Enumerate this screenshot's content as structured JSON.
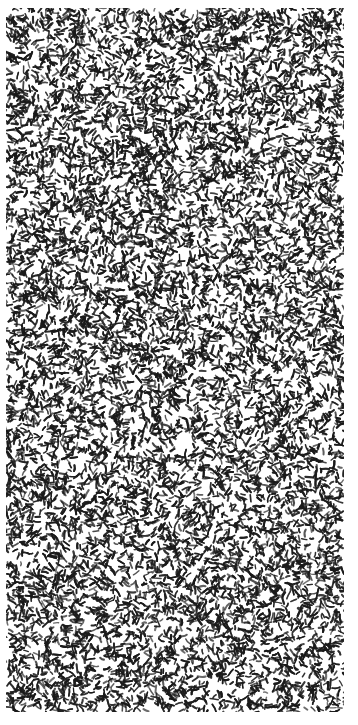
{
  "image": {
    "kind": "noise-texture",
    "width": 358,
    "height": 725,
    "pattern_area": {
      "x": 6,
      "y": 8,
      "width": 338,
      "height": 704
    },
    "colors": {
      "background": "#ffffff",
      "ink": "#1a1a1a",
      "mid": "#777777"
    }
  }
}
